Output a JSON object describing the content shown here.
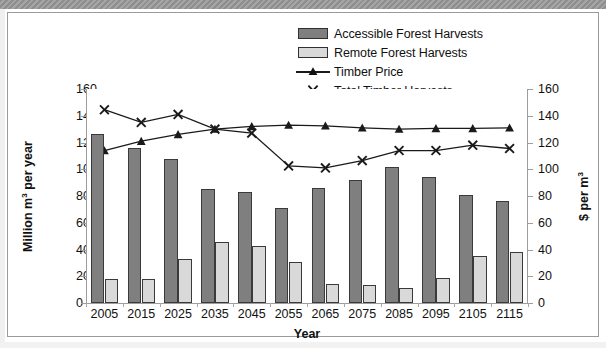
{
  "chart_data": {
    "type": "bar",
    "title": "",
    "xlabel": "Year",
    "ylabel": "Million m3 per year",
    "ylabel_secondary": "$ per m3",
    "categories": [
      "2005",
      "2015",
      "2025",
      "2035",
      "2045",
      "2055",
      "2065",
      "2075",
      "2085",
      "2095",
      "2105",
      "2115"
    ],
    "ylim": [
      0,
      160
    ],
    "ylim_secondary": [
      0,
      160
    ],
    "yticks": [
      0,
      20,
      40,
      60,
      80,
      100,
      120,
      140,
      160
    ],
    "yticks_secondary": [
      0,
      20,
      40,
      60,
      80,
      100,
      120,
      140,
      160
    ],
    "grid": false,
    "legend_position": "top-right",
    "series": [
      {
        "name": "Accessible Forest Harvests",
        "kind": "bar",
        "axis": "left",
        "color": "#7f7f7f",
        "values": [
          126.5,
          116,
          108,
          85,
          83,
          71,
          86,
          92,
          102,
          94.5,
          81,
          76.5
        ]
      },
      {
        "name": "Remote Forest Harvests",
        "kind": "bar",
        "axis": "left",
        "color": "#d9d9d9",
        "values": [
          18,
          18,
          33,
          45.5,
          43,
          31,
          14,
          13.5,
          11,
          19,
          35.5,
          38
        ]
      },
      {
        "name": "Timber Price",
        "kind": "line",
        "marker": "triangle",
        "axis": "right",
        "color": "#1a1a1a",
        "values": [
          114,
          121,
          126,
          130,
          132,
          133,
          132.5,
          131,
          130,
          130.5,
          130.5,
          131
        ]
      },
      {
        "name": "Total Timber Harvests",
        "kind": "line",
        "marker": "cross",
        "axis": "left",
        "color": "#1a1a1a",
        "values": [
          144.5,
          135,
          141,
          130,
          127,
          102.5,
          101,
          106.5,
          114,
          114,
          118,
          115.5
        ]
      }
    ]
  },
  "legend": {
    "items": [
      {
        "label": "Accessible Forest Harvests",
        "key": "swatch-dark"
      },
      {
        "label": "Remote Forest Harvests",
        "key": "swatch-light"
      },
      {
        "label": "Timber Price",
        "key": "line-triangle"
      },
      {
        "label": "Total Timber Harvests",
        "key": "line-cross"
      }
    ]
  },
  "axes": {
    "left_title_prefix": "Million m",
    "left_title_sup": "3",
    "left_title_suffix": " per year",
    "right_title_prefix": "$ per m",
    "right_title_sup": "3",
    "x_title": "Year"
  }
}
